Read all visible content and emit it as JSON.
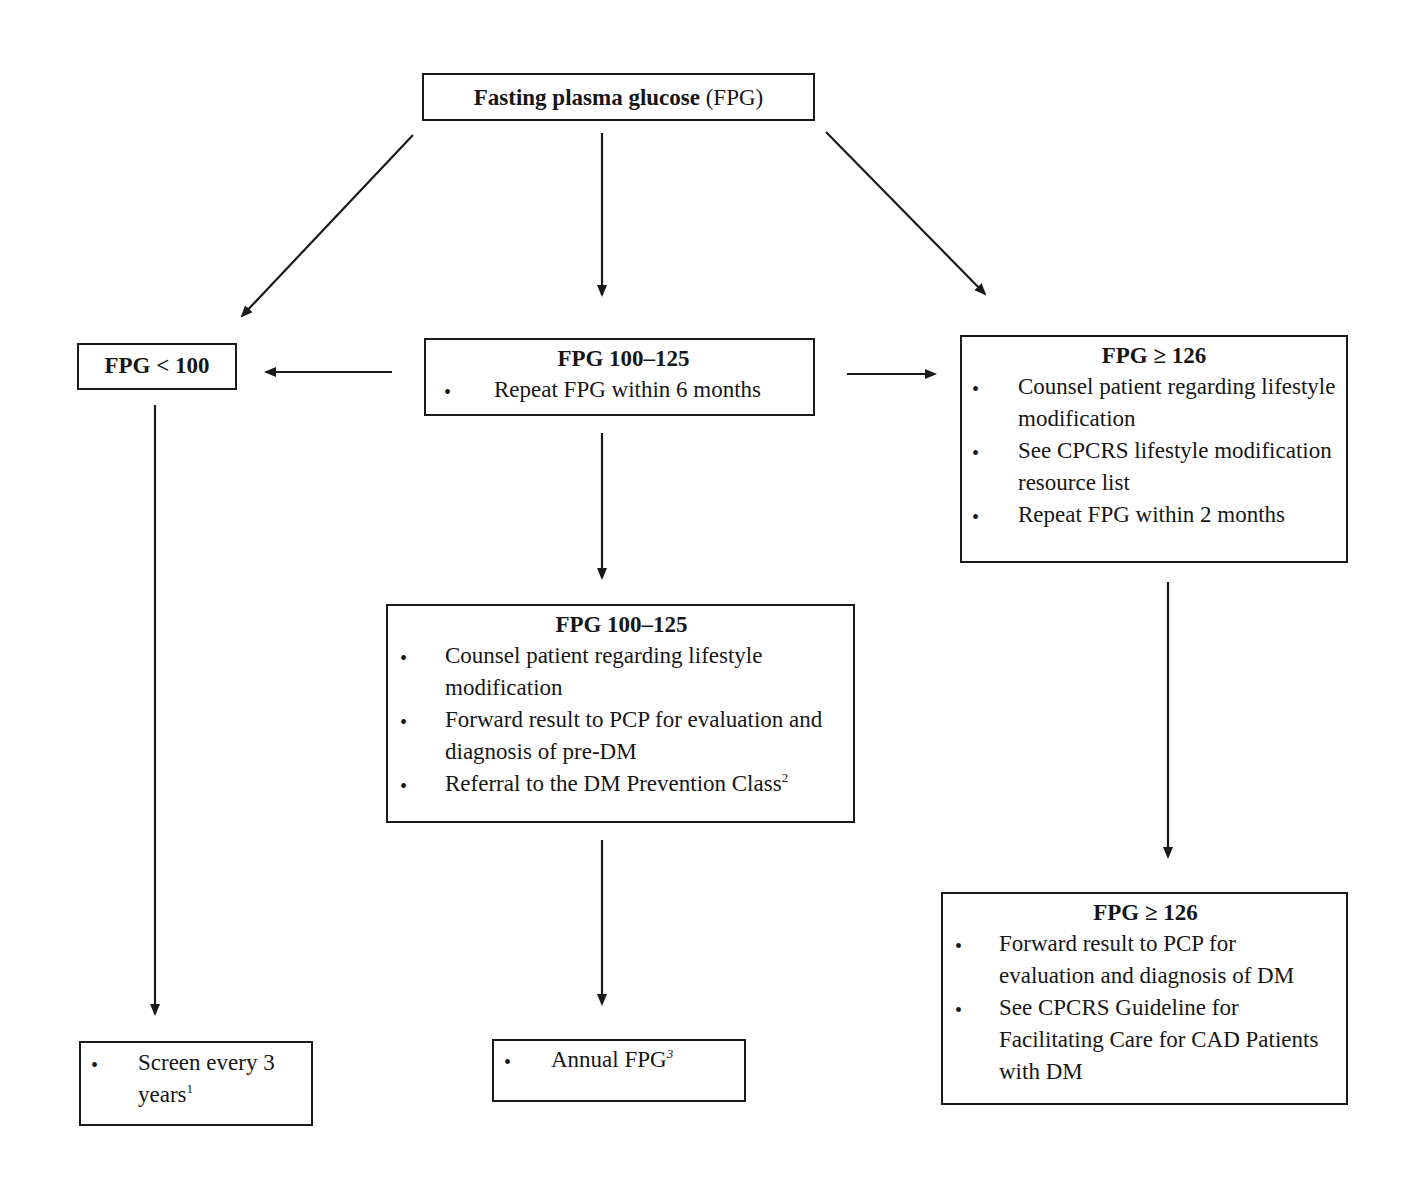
{
  "diagram": {
    "root": {
      "title_bold": "Fasting plasma glucose",
      "title_normal": " (FPG)"
    },
    "low": {
      "title": "FPG < 100"
    },
    "mid": {
      "title": "FPG 100–125",
      "items": [
        "Repeat FPG within 6 months"
      ]
    },
    "high": {
      "title": "FPG ≥ 126",
      "items": [
        "Counsel patient regarding lifestyle modification",
        "See CPCRS lifestyle modification resource list",
        "Repeat FPG within 2 months"
      ]
    },
    "mid_confirmed": {
      "title": "FPG 100–125",
      "items": [
        "Counsel patient regarding lifestyle modification",
        "Forward result to PCP for evaluation and diagnosis of pre-DM",
        "Referral to the DM Prevention Class"
      ],
      "item3_sup": "2"
    },
    "high_confirmed": {
      "title": "FPG ≥ 126",
      "items": [
        "Forward result to PCP for evaluation and diagnosis of DM",
        "See CPCRS Guideline for Facilitating Care for CAD Patients with DM"
      ]
    },
    "low_outcome": {
      "items": [
        "Screen every 3 years"
      ],
      "sup": "1"
    },
    "mid_outcome": {
      "items": [
        "Annual FPG"
      ],
      "sup": "3"
    },
    "bullet": "•",
    "colors": {
      "stroke": "#1a1a1a",
      "background": "#ffffff",
      "text": "#161616"
    }
  }
}
